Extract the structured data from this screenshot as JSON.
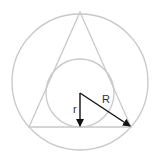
{
  "diagram": {
    "type": "geometry",
    "labels": {
      "inner_radius": "r",
      "outer_radius": "R"
    },
    "colors": {
      "shape_stroke": "#c8c8c8",
      "arrow": "#111111",
      "background": "#ffffff"
    }
  }
}
